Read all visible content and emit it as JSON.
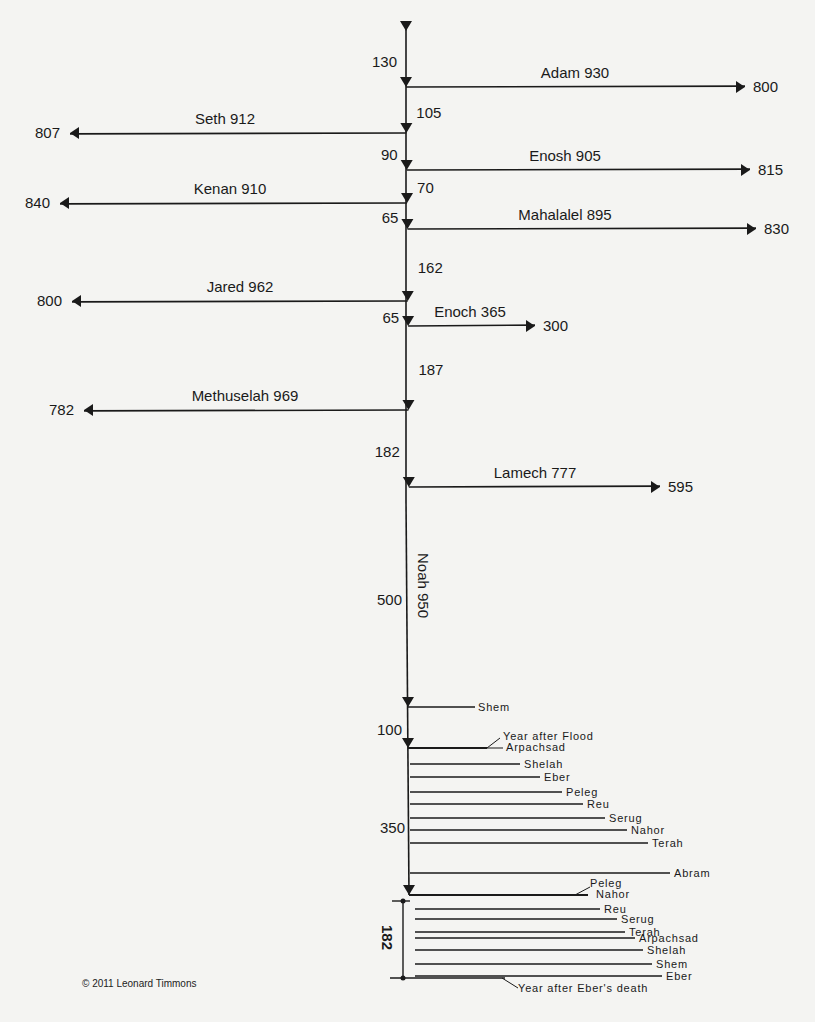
{
  "colors": {
    "background": "#f4f4f2",
    "ink": "#1a1a1a"
  },
  "spine_x": 406,
  "spine_top": 25,
  "patriarchs": [
    {
      "name": "Adam",
      "lifespan": 930,
      "after_son": 800,
      "y": 87,
      "dir": "right",
      "end_x": 745,
      "label_x": 575,
      "gap_before": 130,
      "gap_label_y": 62,
      "gap_label_side": "left"
    },
    {
      "name": "Seth",
      "lifespan": 912,
      "after_son": 807,
      "y": 133,
      "dir": "left",
      "end_x": 70,
      "label_x": 225,
      "gap_before": 105,
      "gap_label_y": 113,
      "gap_label_side": "right"
    },
    {
      "name": "Enosh",
      "lifespan": 905,
      "after_son": 815,
      "y": 170,
      "dir": "right",
      "end_x": 750,
      "label_x": 565,
      "gap_before": 90,
      "gap_label_y": 155,
      "gap_label_side": "left"
    },
    {
      "name": "Kenan",
      "lifespan": 910,
      "after_son": 840,
      "y": 203,
      "dir": "left",
      "end_x": 60,
      "label_x": 230,
      "gap_before": 70,
      "gap_label_y": 188,
      "gap_label_side": "right"
    },
    {
      "name": "Mahalalel",
      "lifespan": 895,
      "after_son": 830,
      "y": 229,
      "dir": "right",
      "end_x": 756,
      "label_x": 565,
      "gap_before": 65,
      "gap_label_y": 218,
      "gap_label_side": "left"
    },
    {
      "name": "Jared",
      "lifespan": 962,
      "after_son": 800,
      "y": 301,
      "dir": "left",
      "end_x": 72,
      "label_x": 240,
      "gap_before": 162,
      "gap_label_y": 268,
      "gap_label_side": "right"
    },
    {
      "name": "Enoch",
      "lifespan": 365,
      "after_son": 300,
      "y": 326,
      "dir": "right",
      "end_x": 535,
      "label_x": 470,
      "gap_before": 65,
      "gap_label_y": 318,
      "gap_label_side": "left"
    },
    {
      "name": "Methuselah",
      "lifespan": 969,
      "after_son": 782,
      "y": 410,
      "dir": "left",
      "end_x": 84,
      "label_x": 245,
      "gap_before": 187,
      "gap_label_y": 370,
      "gap_label_side": "right"
    },
    {
      "name": "Lamech",
      "lifespan": 777,
      "after_son": 595,
      "y": 487,
      "dir": "right",
      "end_x": 660,
      "label_x": 535,
      "gap_before": 182,
      "gap_label_y": 452,
      "gap_label_side": "left"
    }
  ],
  "noah": {
    "name": "Noah",
    "lifespan": 950,
    "label": "Noah 950",
    "gap_before": 500,
    "gap_label_y": 600
  },
  "shem": {
    "label": "Shem",
    "y": 707,
    "end_x": 475,
    "gap_before": 100,
    "gap_label_y": 730
  },
  "flood_line": {
    "y": 748,
    "label_top": "Year after Flood",
    "label_bottom": "Arpachsad"
  },
  "post_flood_lines": [
    {
      "label": "Shelah",
      "y": 764,
      "end_x": 520
    },
    {
      "label": "Eber",
      "y": 777,
      "end_x": 540
    },
    {
      "label": "Peleg",
      "y": 792,
      "end_x": 562
    },
    {
      "label": "Reu",
      "y": 804,
      "end_x": 583
    },
    {
      "label": "Serug",
      "y": 818,
      "end_x": 605
    },
    {
      "label": "Nahor",
      "y": 830,
      "end_x": 627
    },
    {
      "label": "Terah",
      "y": 843,
      "end_x": 648
    },
    {
      "label": "Abram",
      "y": 873,
      "end_x": 670
    }
  ],
  "gap_350": {
    "value": 350,
    "y": 828
  },
  "bottom_section": {
    "top_y": 895,
    "bottom_y": 978,
    "bracket_label": "182",
    "top_labels": [
      "Peleg",
      "Nahor"
    ],
    "lines": [
      {
        "label": "Reu",
        "y": 909,
        "end_x": 600
      },
      {
        "label": "Serug",
        "y": 919,
        "end_x": 617
      },
      {
        "label": "Terah",
        "y": 932,
        "end_x": 625
      },
      {
        "label": "Arpachsad",
        "y": 938,
        "end_x": 635
      },
      {
        "label": "Shelah",
        "y": 950,
        "end_x": 643
      },
      {
        "label": "Shem",
        "y": 964,
        "end_x": 652
      },
      {
        "label": "Eber",
        "y": 976,
        "end_x": 662
      }
    ],
    "bottom_label": "Year after Eber's death"
  },
  "copyright": "© 2011 Leonard Timmons"
}
